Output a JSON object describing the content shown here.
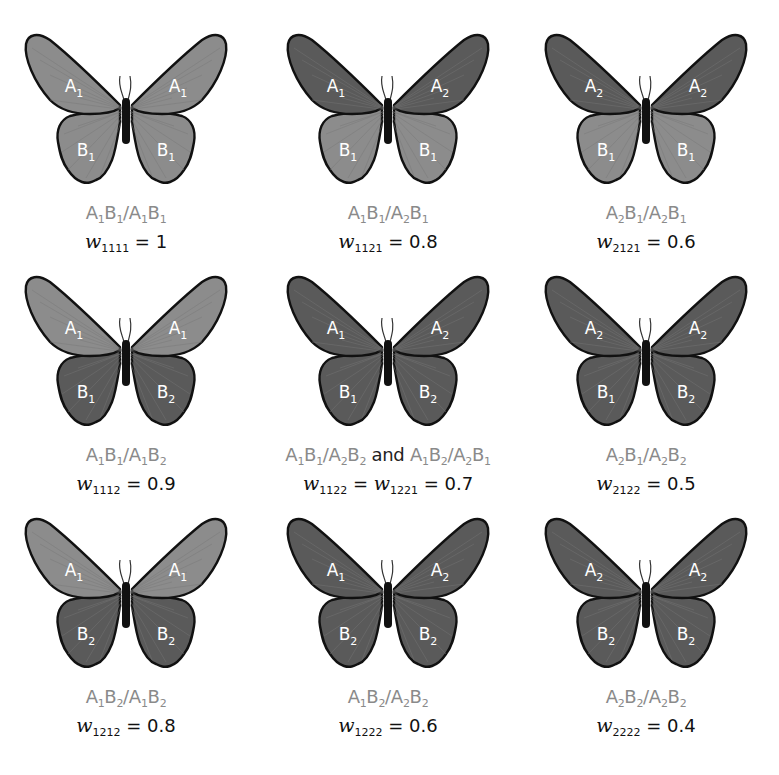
{
  "figure": {
    "colors": {
      "light_wing": "#8c8c8c",
      "dark_wing": "#5a5a5a",
      "outline": "#111111",
      "vein": "#777777",
      "genotype_text": "#8a8a8a",
      "fitness_text": "#111111",
      "wing_label_text": "#ffffff"
    },
    "cells": [
      {
        "row": 1,
        "col": 1,
        "wings": {
          "fore_left": "A1",
          "fore_right": "A1",
          "hind_left": "B1",
          "hind_right": "B1"
        },
        "shade": {
          "fore": "light",
          "hind": "light"
        },
        "genotype": "A1B1/A1B1",
        "w_sub": "1111",
        "w_value": "1"
      },
      {
        "row": 1,
        "col": 2,
        "wings": {
          "fore_left": "A1",
          "fore_right": "A2",
          "hind_left": "B1",
          "hind_right": "B1"
        },
        "shade": {
          "fore": "dark",
          "hind": "light"
        },
        "genotype": "A1B1/A2B1",
        "w_sub": "1121",
        "w_value": "0.8"
      },
      {
        "row": 1,
        "col": 3,
        "wings": {
          "fore_left": "A2",
          "fore_right": "A2",
          "hind_left": "B1",
          "hind_right": "B1"
        },
        "shade": {
          "fore": "dark",
          "hind": "light"
        },
        "genotype": "A2B1/A2B1",
        "w_sub": "2121",
        "w_value": "0.6"
      },
      {
        "row": 2,
        "col": 1,
        "wings": {
          "fore_left": "A1",
          "fore_right": "A1",
          "hind_left": "B1",
          "hind_right": "B2"
        },
        "shade": {
          "fore": "light",
          "hind": "dark"
        },
        "genotype": "A1B1/A1B2",
        "w_sub": "1112",
        "w_value": "0.9"
      },
      {
        "row": 2,
        "col": 2,
        "wings": {
          "fore_left": "A1",
          "fore_right": "A2",
          "hind_left": "B1",
          "hind_right": "B2"
        },
        "shade": {
          "fore": "dark",
          "hind": "dark"
        },
        "genotype": "A1B1/A2B2",
        "genotype_alt": "A1B2/A2B1",
        "joiner": "and",
        "w_sub": "1122",
        "w_sub_alt": "1221",
        "w_value": "0.7"
      },
      {
        "row": 2,
        "col": 3,
        "wings": {
          "fore_left": "A2",
          "fore_right": "A2",
          "hind_left": "B1",
          "hind_right": "B2"
        },
        "shade": {
          "fore": "dark",
          "hind": "dark"
        },
        "genotype": "A2B1/A2B2",
        "w_sub": "2122",
        "w_value": "0.5"
      },
      {
        "row": 3,
        "col": 1,
        "wings": {
          "fore_left": "A1",
          "fore_right": "A1",
          "hind_left": "B2",
          "hind_right": "B2"
        },
        "shade": {
          "fore": "light",
          "hind": "dark"
        },
        "genotype": "A1B2/A1B2",
        "w_sub": "1212",
        "w_value": "0.8"
      },
      {
        "row": 3,
        "col": 2,
        "wings": {
          "fore_left": "A1",
          "fore_right": "A2",
          "hind_left": "B2",
          "hind_right": "B2"
        },
        "shade": {
          "fore": "dark",
          "hind": "dark"
        },
        "genotype": "A1B2/A2B2",
        "w_sub": "1222",
        "w_value": "0.6"
      },
      {
        "row": 3,
        "col": 3,
        "wings": {
          "fore_left": "A2",
          "fore_right": "A2",
          "hind_left": "B2",
          "hind_right": "B2"
        },
        "shade": {
          "fore": "dark",
          "hind": "dark"
        },
        "genotype": "A2B2/A2B2",
        "w_sub": "2222",
        "w_value": "0.4"
      }
    ]
  }
}
